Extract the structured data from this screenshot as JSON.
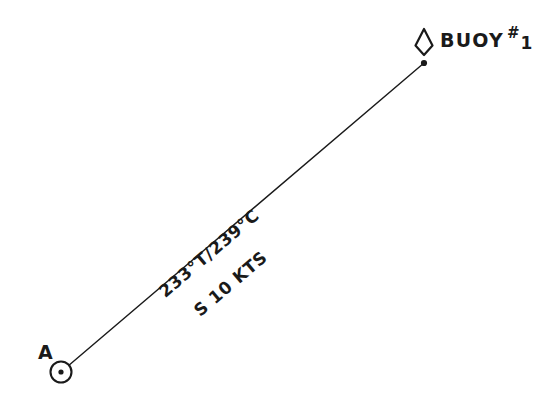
{
  "document": {
    "kind": "nautical-dead-reckoning-plot",
    "background_color": "#ffffff",
    "ink_color": "#1a1a1a"
  },
  "points": {
    "departure": {
      "label": "A",
      "symbol": "fix-circle-dot",
      "x": 61,
      "y": 372
    },
    "destination": {
      "label_name": "BUOY",
      "label_hash": "#",
      "label_number": "1",
      "symbol": "buoy-diamond",
      "x": 424,
      "y": 63
    }
  },
  "course_line": {
    "from_x": 61,
    "from_y": 372,
    "to_x": 424,
    "to_y": 63,
    "stroke_color": "#1a1a1a",
    "stroke_width": 1.4
  },
  "annotations": {
    "bearing": "233°T/239°C",
    "speed": "S 10 KTS",
    "rotation_degrees": -40.4
  }
}
